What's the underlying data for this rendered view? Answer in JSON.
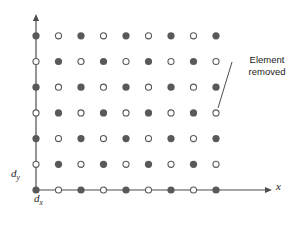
{
  "figure": {
    "title": "",
    "background_color": "#ffffff",
    "width": 304,
    "height": 226
  },
  "axes": {
    "x_axis": {
      "label": "x",
      "origin_px": [
        36,
        190
      ],
      "end_px": [
        272,
        190
      ],
      "arrow": true,
      "color": "#4d4d4d"
    },
    "y_axis": {
      "label": "",
      "origin_px": [
        36,
        190
      ],
      "end_px": [
        36,
        14
      ],
      "arrow": true,
      "color": "#4d4d4d"
    },
    "spacing_labels": {
      "dx": {
        "base": "d",
        "sub": "x"
      },
      "dy": {
        "base": "d",
        "sub": "y"
      }
    }
  },
  "annotation": {
    "line1": "Element",
    "line2": "removed",
    "leader_from_px": [
      232,
      62
    ],
    "leader_to_px": [
      218,
      108
    ]
  },
  "chart_data": {
    "type": "scatter",
    "title": "",
    "xlabel": "x",
    "ylabel": "",
    "grid": false,
    "legend": "none",
    "columns": 9,
    "rows": 7,
    "x_spacing_px": 22.5,
    "y_spacing_px": 25.7,
    "origin_px": [
      36,
      190
    ],
    "marker_filled_color": "#595959",
    "marker_open_fill": "#ffffff",
    "marker_open_stroke": "#595959",
    "marker_radius_px": 3.6,
    "pattern_rule": "filled when (col + row) is even, open when (col + row) is odd",
    "points": [
      {
        "col": 0,
        "row": 0,
        "style": "filled"
      },
      {
        "col": 1,
        "row": 0,
        "style": "open"
      },
      {
        "col": 2,
        "row": 0,
        "style": "filled"
      },
      {
        "col": 3,
        "row": 0,
        "style": "open"
      },
      {
        "col": 4,
        "row": 0,
        "style": "filled"
      },
      {
        "col": 5,
        "row": 0,
        "style": "open"
      },
      {
        "col": 6,
        "row": 0,
        "style": "filled"
      },
      {
        "col": 7,
        "row": 0,
        "style": "open"
      },
      {
        "col": 8,
        "row": 0,
        "style": "filled"
      },
      {
        "col": 0,
        "row": 1,
        "style": "open"
      },
      {
        "col": 1,
        "row": 1,
        "style": "filled"
      },
      {
        "col": 2,
        "row": 1,
        "style": "open"
      },
      {
        "col": 3,
        "row": 1,
        "style": "filled"
      },
      {
        "col": 4,
        "row": 1,
        "style": "open"
      },
      {
        "col": 5,
        "row": 1,
        "style": "filled"
      },
      {
        "col": 6,
        "row": 1,
        "style": "open"
      },
      {
        "col": 7,
        "row": 1,
        "style": "filled"
      },
      {
        "col": 8,
        "row": 1,
        "style": "open"
      },
      {
        "col": 0,
        "row": 2,
        "style": "filled"
      },
      {
        "col": 1,
        "row": 2,
        "style": "open"
      },
      {
        "col": 2,
        "row": 2,
        "style": "filled"
      },
      {
        "col": 3,
        "row": 2,
        "style": "open"
      },
      {
        "col": 4,
        "row": 2,
        "style": "filled"
      },
      {
        "col": 5,
        "row": 2,
        "style": "open"
      },
      {
        "col": 6,
        "row": 2,
        "style": "filled"
      },
      {
        "col": 7,
        "row": 2,
        "style": "open"
      },
      {
        "col": 8,
        "row": 2,
        "style": "filled"
      },
      {
        "col": 0,
        "row": 3,
        "style": "open"
      },
      {
        "col": 1,
        "row": 3,
        "style": "filled"
      },
      {
        "col": 2,
        "row": 3,
        "style": "open"
      },
      {
        "col": 3,
        "row": 3,
        "style": "filled"
      },
      {
        "col": 4,
        "row": 3,
        "style": "open"
      },
      {
        "col": 5,
        "row": 3,
        "style": "filled"
      },
      {
        "col": 6,
        "row": 3,
        "style": "open"
      },
      {
        "col": 7,
        "row": 3,
        "style": "filled"
      },
      {
        "col": 8,
        "row": 3,
        "style": "open"
      },
      {
        "col": 0,
        "row": 4,
        "style": "filled"
      },
      {
        "col": 1,
        "row": 4,
        "style": "open"
      },
      {
        "col": 2,
        "row": 4,
        "style": "filled"
      },
      {
        "col": 3,
        "row": 4,
        "style": "open"
      },
      {
        "col": 4,
        "row": 4,
        "style": "filled"
      },
      {
        "col": 5,
        "row": 4,
        "style": "open"
      },
      {
        "col": 6,
        "row": 4,
        "style": "filled"
      },
      {
        "col": 7,
        "row": 4,
        "style": "open"
      },
      {
        "col": 8,
        "row": 4,
        "style": "filled"
      },
      {
        "col": 0,
        "row": 5,
        "style": "open"
      },
      {
        "col": 1,
        "row": 5,
        "style": "filled"
      },
      {
        "col": 2,
        "row": 5,
        "style": "open"
      },
      {
        "col": 3,
        "row": 5,
        "style": "filled"
      },
      {
        "col": 4,
        "row": 5,
        "style": "open"
      },
      {
        "col": 5,
        "row": 5,
        "style": "filled"
      },
      {
        "col": 6,
        "row": 5,
        "style": "open"
      },
      {
        "col": 7,
        "row": 5,
        "style": "filled"
      },
      {
        "col": 8,
        "row": 5,
        "style": "open"
      },
      {
        "col": 0,
        "row": 6,
        "style": "filled"
      },
      {
        "col": 1,
        "row": 6,
        "style": "open"
      },
      {
        "col": 2,
        "row": 6,
        "style": "filled"
      },
      {
        "col": 3,
        "row": 6,
        "style": "open"
      },
      {
        "col": 4,
        "row": 6,
        "style": "filled"
      },
      {
        "col": 5,
        "row": 6,
        "style": "open"
      },
      {
        "col": 6,
        "row": 6,
        "style": "filled"
      },
      {
        "col": 7,
        "row": 6,
        "style": "open"
      },
      {
        "col": 8,
        "row": 6,
        "style": "filled"
      }
    ],
    "annotated_point": {
      "col": 8,
      "row": 3,
      "style": "open",
      "label": "Element removed"
    }
  }
}
